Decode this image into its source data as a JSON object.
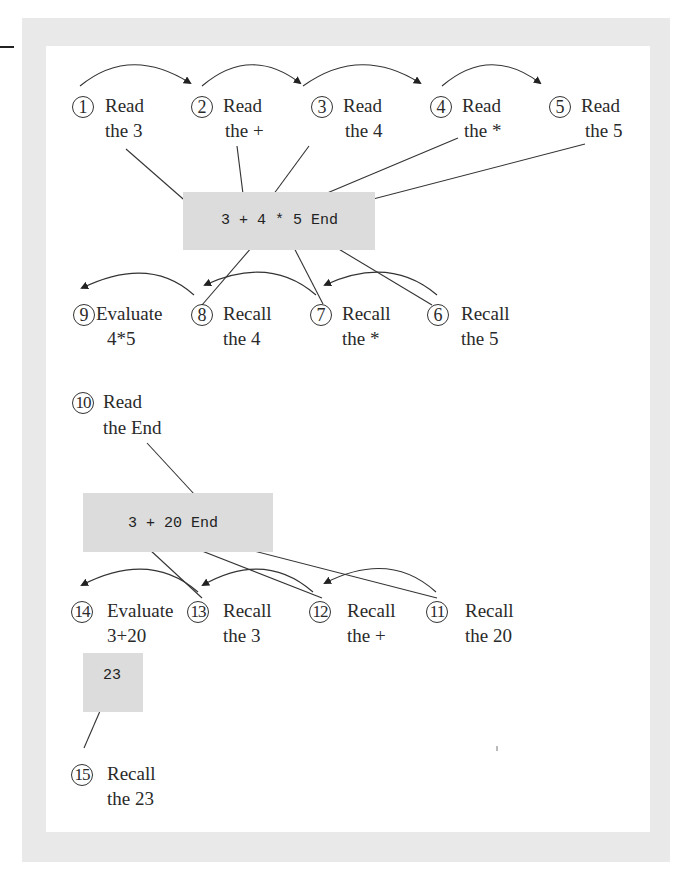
{
  "diagram": {
    "type": "expression-evaluation-stack-trace",
    "expressions": [
      {
        "id": "expr-1",
        "text": "3 + 4 * 5 End"
      },
      {
        "id": "expr-2",
        "text": "3 + 20 End"
      },
      {
        "id": "expr-3",
        "text": "23"
      }
    ],
    "steps": [
      {
        "n": "1",
        "action": "Read",
        "target": "the 3"
      },
      {
        "n": "2",
        "action": "Read",
        "target": "the +"
      },
      {
        "n": "3",
        "action": "Read",
        "target": "the 4"
      },
      {
        "n": "4",
        "action": "Read",
        "target": "the *"
      },
      {
        "n": "5",
        "action": "Read",
        "target": "the 5"
      },
      {
        "n": "6",
        "action": "Recall",
        "target": "the 5"
      },
      {
        "n": "7",
        "action": "Recall",
        "target": "the *"
      },
      {
        "n": "8",
        "action": "Recall",
        "target": "the 4"
      },
      {
        "n": "9",
        "action": "Evaluate",
        "target": "4*5"
      },
      {
        "n": "10",
        "action": "Read",
        "target": "the End"
      },
      {
        "n": "11",
        "action": "Recall",
        "target": "the 20"
      },
      {
        "n": "12",
        "action": "Recall",
        "target": "the +"
      },
      {
        "n": "13",
        "action": "Recall",
        "target": "the 3"
      },
      {
        "n": "14",
        "action": "Evaluate",
        "target": "3+20"
      },
      {
        "n": "15",
        "action": "Recall",
        "target": "the 23"
      }
    ]
  }
}
